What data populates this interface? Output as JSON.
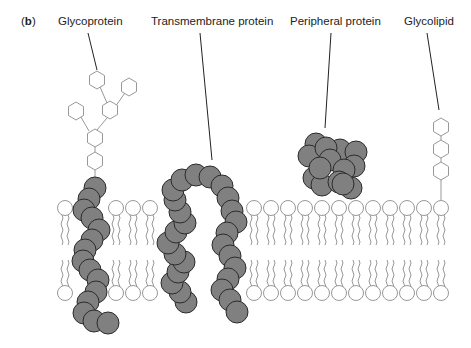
{
  "figure": {
    "panel_label_open": "(",
    "panel_label_letter": "b",
    "panel_label_close": ")",
    "labels": {
      "glycoprotein": "Glycoprotein",
      "transmembrane_protein": "Transmembrane protein",
      "peripheral_protein": "Peripheral protein",
      "glycolipid": "Glycolipid"
    },
    "colors": {
      "protein_fill": "#808080",
      "protein_stroke": "#2b2b2b",
      "lipid_stroke": "#8c8c8c",
      "sugar_stroke": "#8c8c8c",
      "leader_line": "#222222"
    }
  }
}
